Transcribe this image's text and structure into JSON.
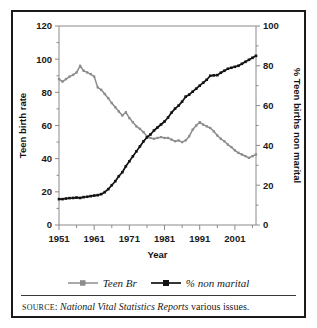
{
  "chart_data": {
    "type": "line",
    "title": "",
    "xlabel": "Year",
    "ylabel": "Teen birth rate",
    "y2label": "% Teen births non marital",
    "xlim": [
      1951,
      2007
    ],
    "ylim": [
      0,
      120
    ],
    "y2lim": [
      0,
      100
    ],
    "xticks": [
      1951,
      1961,
      1971,
      1981,
      1991,
      2001
    ],
    "xminor_step": 5,
    "yticks": [
      0,
      20,
      40,
      60,
      80,
      100,
      120
    ],
    "y2ticks": [
      0,
      20,
      40,
      60,
      80,
      100
    ],
    "grid": false,
    "legend_position": "below",
    "series": [
      {
        "name": "Teen Br",
        "axis": "left",
        "color": "#8c8c8c",
        "marker": "square",
        "x": [
          1951,
          1952,
          1953,
          1954,
          1955,
          1956,
          1957,
          1958,
          1959,
          1960,
          1961,
          1962,
          1963,
          1964,
          1965,
          1966,
          1967,
          1968,
          1969,
          1970,
          1971,
          1972,
          1973,
          1974,
          1975,
          1976,
          1977,
          1978,
          1979,
          1980,
          1981,
          1982,
          1983,
          1984,
          1985,
          1986,
          1987,
          1988,
          1989,
          1990,
          1991,
          1992,
          1993,
          1994,
          1995,
          1996,
          1997,
          1998,
          1999,
          2000,
          2001,
          2002,
          2003,
          2004,
          2005,
          2006,
          2007
        ],
        "values": [
          88.0,
          86.5,
          88.0,
          89.5,
          90.5,
          92.0,
          96.0,
          93.0,
          92.0,
          91.0,
          89.5,
          83.0,
          81.5,
          79.0,
          76.5,
          73.5,
          71.0,
          68.5,
          66.0,
          68.0,
          64.5,
          62.0,
          59.5,
          58.0,
          56.0,
          53.5,
          52.5,
          52.0,
          52.5,
          53.0,
          52.5,
          52.5,
          51.5,
          50.5,
          51.0,
          50.0,
          51.0,
          53.5,
          57.5,
          60.0,
          62.0,
          60.5,
          59.5,
          58.5,
          56.5,
          54.0,
          52.0,
          50.5,
          48.5,
          47.0,
          45.0,
          43.5,
          42.5,
          41.5,
          40.5,
          41.5,
          42.5
        ]
      },
      {
        "name": "% non marital",
        "axis": "right",
        "color": "#121212",
        "marker": "square",
        "x": [
          1951,
          1952,
          1953,
          1954,
          1955,
          1956,
          1957,
          1958,
          1959,
          1960,
          1961,
          1962,
          1963,
          1964,
          1965,
          1966,
          1967,
          1968,
          1969,
          1970,
          1971,
          1972,
          1973,
          1974,
          1975,
          1976,
          1977,
          1978,
          1979,
          1980,
          1981,
          1982,
          1983,
          1984,
          1985,
          1986,
          1987,
          1988,
          1989,
          1990,
          1991,
          1992,
          1993,
          1994,
          1995,
          1996,
          1997,
          1998,
          1999,
          2000,
          2001,
          2002,
          2003,
          2004,
          2005,
          2006,
          2007
        ],
        "values": [
          13.0,
          13.0,
          13.3,
          13.5,
          13.6,
          13.8,
          13.6,
          14.0,
          14.2,
          14.5,
          14.8,
          15.0,
          15.5,
          16.5,
          18.0,
          20.0,
          22.0,
          24.5,
          26.5,
          29.5,
          32.0,
          34.5,
          37.0,
          39.5,
          42.0,
          44.0,
          45.5,
          47.5,
          49.0,
          50.5,
          52.0,
          54.0,
          56.5,
          58.5,
          60.0,
          62.0,
          64.5,
          65.5,
          67.0,
          68.5,
          70.0,
          71.5,
          73.0,
          75.0,
          75.2,
          75.3,
          76.5,
          77.5,
          78.5,
          79.0,
          79.5,
          80.0,
          81.0,
          82.0,
          83.0,
          84.0,
          85.0
        ]
      }
    ]
  },
  "legend": {
    "items": [
      {
        "label": "Teen Br",
        "color": "#8c8c8c"
      },
      {
        "label": "% non marital",
        "color": "#121212"
      }
    ]
  },
  "source": {
    "prefix": "SOURCE",
    "separator": ": ",
    "publication": "National Vital Statistics Reports",
    "suffix": " various issues."
  }
}
